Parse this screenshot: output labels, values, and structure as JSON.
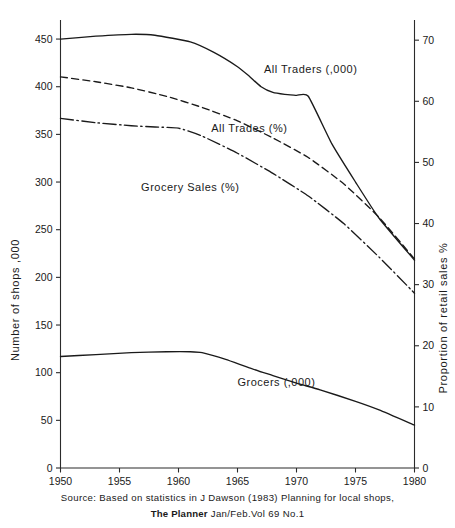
{
  "chart_data": {
    "type": "line",
    "title": "",
    "xlabel": "",
    "ylabel": "Number of shops ,000",
    "y2label": "Proportion of retail sales %",
    "xlim": [
      1950,
      1980
    ],
    "ylim": [
      0,
      470
    ],
    "y2lim": [
      0,
      73.3
    ],
    "grid": false,
    "legend_position": "inline-annotations",
    "xticks": [
      1950,
      1955,
      1960,
      1965,
      1970,
      1975,
      1980
    ],
    "xtick_labels": [
      "1950",
      "1955",
      "1960",
      "1965",
      "1970",
      "1975",
      "1980"
    ],
    "yticks": [
      0,
      50,
      100,
      150,
      200,
      250,
      300,
      350,
      400,
      450
    ],
    "ytick_labels": [
      "0",
      "50",
      "100",
      "150",
      "200",
      "250",
      "300",
      "350",
      "400",
      "450"
    ],
    "y2ticks": [
      0,
      10,
      20,
      30,
      40,
      50,
      60,
      70
    ],
    "y2tick_labels": [
      "0",
      "10",
      "20",
      "30",
      "40",
      "50",
      "60",
      "70"
    ],
    "series": [
      {
        "name": "All Traders (,000)",
        "axis": "left",
        "style": "solid",
        "label_x": 1971.2,
        "label_y": 414,
        "x": [
          1950,
          1953,
          1956,
          1958,
          1961,
          1963,
          1965,
          1966,
          1967,
          1968,
          1969,
          1970,
          1971,
          1973,
          1975,
          1977,
          1980
        ],
        "y": [
          450,
          453,
          455,
          454,
          447,
          436,
          421,
          411,
          400,
          394,
          392,
          391,
          390,
          340,
          300,
          262,
          218
        ]
      },
      {
        "name": "All Trades (%)",
        "axis": "right",
        "style": "dashed",
        "label_x": 1966.0,
        "label_y": 55.0,
        "x": [
          1950,
          1953,
          1956,
          1959,
          1962,
          1965,
          1968,
          1971,
          1974,
          1977,
          1980
        ],
        "y": [
          64.0,
          63.2,
          62.2,
          60.8,
          59.0,
          56.8,
          54.0,
          50.8,
          46.5,
          41.0,
          34.2
        ]
      },
      {
        "name": "Grocery Sales (%)",
        "axis": "right",
        "style": "dashdot",
        "label_x": 1961.0,
        "label_y": 45.4,
        "x": [
          1950,
          1953,
          1956,
          1958,
          1960,
          1962,
          1965,
          1968,
          1971,
          1974,
          1977,
          1980
        ],
        "y": [
          57.2,
          56.5,
          56.0,
          55.8,
          55.6,
          54.3,
          51.5,
          48.2,
          44.5,
          40.0,
          34.5,
          28.6
        ]
      },
      {
        "name": "Grocers (,000)",
        "axis": "left",
        "style": "solid",
        "label_x": 1968.3,
        "label_y": 86,
        "x": [
          1950,
          1953,
          1956,
          1959,
          1961,
          1962,
          1964,
          1966,
          1968,
          1970,
          1972,
          1975,
          1977,
          1980
        ],
        "y": [
          117,
          119,
          121,
          122,
          122,
          121,
          114,
          105,
          97,
          89,
          82,
          70,
          61,
          45
        ]
      }
    ]
  },
  "caption": {
    "source_line": "Source: Based on statistics in J Dawson (1983) Planning for local shops,",
    "journal_name": "The Planner",
    "journal_issue": "Jan/Feb.Vol 69 No.1"
  }
}
